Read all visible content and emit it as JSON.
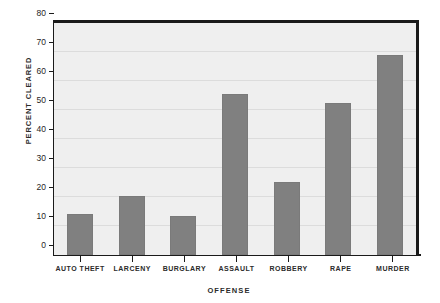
{
  "chart_data": {
    "type": "bar",
    "title": "",
    "xlabel": "OFFENSE",
    "ylabel": "PERCENT CLEARED",
    "categories": [
      "Auto Theft",
      "Larceny",
      "Burglary",
      "Assault",
      "Robbery",
      "Rape",
      "Murder"
    ],
    "values": [
      14,
      20.5,
      13.3,
      55.5,
      25.3,
      52.3,
      69
    ],
    "ylim": [
      0,
      80
    ],
    "ytick_values": [
      0,
      10,
      20,
      30,
      40,
      50,
      60,
      70,
      80
    ],
    "ytick_labels": [
      "0",
      "10",
      "20",
      "30",
      "40",
      "50",
      "60",
      "70",
      "80"
    ],
    "grid": true,
    "legend": false,
    "colors": {
      "bar": "#808080",
      "plot_background": "#efefef",
      "gridline": "#dcdcdc",
      "axis": "#1a1a1a",
      "text": "#2b2b2b",
      "page_background": "#ffffff"
    }
  }
}
